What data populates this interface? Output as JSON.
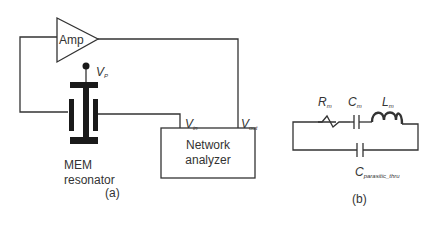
{
  "figure_a": {
    "amplifier_label": "Amp",
    "bias_label": {
      "symbol": "V",
      "subscript": "P"
    },
    "resonator_label_line1": "MEM",
    "resonator_label_line2": "resonator",
    "vin_label": {
      "symbol": "V",
      "subscript": "in"
    },
    "vout_label": {
      "symbol": "V",
      "subscript": "out"
    },
    "analyzer_line1": "Network",
    "analyzer_line2": "analyzer",
    "caption": "(a)"
  },
  "figure_b": {
    "resistor_label": {
      "symbol": "R",
      "subscript": "m"
    },
    "capacitor_label": {
      "symbol": "C",
      "subscript": "m"
    },
    "inductor_label": {
      "symbol": "L",
      "subscript": "m"
    },
    "parasitic_label": {
      "symbol": "C",
      "subscript": "parasitic_thru"
    },
    "caption": "(b)"
  },
  "colors": {
    "line": "#333333",
    "fill": "#1a1a1a",
    "background": "#ffffff"
  }
}
